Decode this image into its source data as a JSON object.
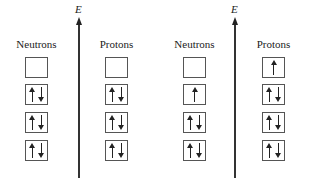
{
  "diagram": {
    "axes": [
      {
        "label": "E",
        "x": 78
      },
      {
        "label": "E",
        "x": 234
      }
    ],
    "panels": [
      {
        "columns": [
          {
            "label": "Neutrons",
            "x": 25,
            "levels": [
              [],
              [
                "up",
                "down"
              ],
              [
                "up",
                "down"
              ],
              [
                "up",
                "down"
              ]
            ]
          },
          {
            "label": "Protons",
            "x": 105,
            "levels": [
              [],
              [
                "up",
                "down"
              ],
              [
                "up",
                "down"
              ],
              [
                "up",
                "down"
              ]
            ]
          }
        ]
      },
      {
        "columns": [
          {
            "label": "Neutrons",
            "x": 183,
            "levels": [
              [],
              [
                "up"
              ],
              [
                "up",
                "down"
              ],
              [
                "up",
                "down"
              ]
            ]
          },
          {
            "label": "Protons",
            "x": 262,
            "levels": [
              [
                "up"
              ],
              [
                "up",
                "down"
              ],
              [
                "up",
                "down"
              ],
              [
                "up",
                "down"
              ]
            ]
          }
        ]
      }
    ]
  }
}
